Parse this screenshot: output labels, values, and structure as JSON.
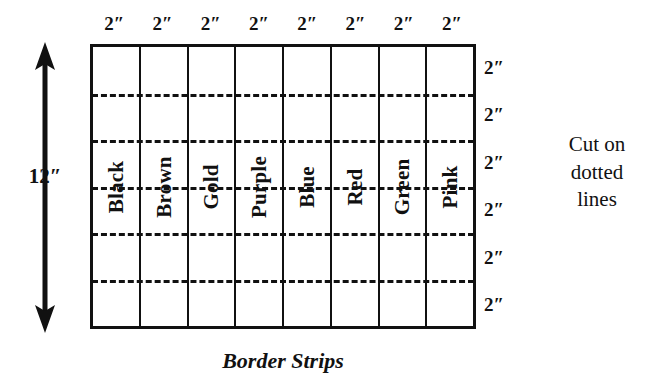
{
  "diagram": {
    "caption": "Border Strips",
    "note_lines": [
      "Cut on",
      "dotted",
      "lines"
    ],
    "height_label": "12″",
    "colors": {
      "ink": "#111111",
      "paper": "#ffffff"
    },
    "top_dimensions": [
      "2″",
      "2″",
      "2″",
      "2″",
      "2″",
      "2″",
      "2″",
      "2″"
    ],
    "right_dimensions": [
      "2″",
      "2″",
      "2″",
      "2″",
      "2″",
      "2″"
    ],
    "strips": [
      {
        "label": "Black"
      },
      {
        "label": "Brown"
      },
      {
        "label": "Gold"
      },
      {
        "label": "Purple"
      },
      {
        "label": "Blue"
      },
      {
        "label": "Red"
      },
      {
        "label": "Green"
      },
      {
        "label": "Pink"
      }
    ],
    "cut_line_count": 5,
    "grid": {
      "columns": 8,
      "rows": 6,
      "total_width_label": "16″",
      "total_height_label": "12″"
    }
  }
}
